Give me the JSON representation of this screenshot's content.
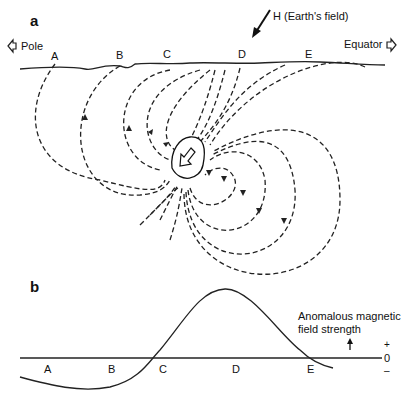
{
  "panel_a": {
    "label": "a",
    "pole": "Pole",
    "equator": "Equator",
    "earth_field": "H (Earth's field)",
    "stations": [
      "A",
      "B",
      "C",
      "D",
      "E"
    ]
  },
  "panel_b": {
    "label": "b",
    "axis_title_line1": "Anomalous magnetic",
    "axis_title_line2": "field strength",
    "plus": "+",
    "zero": "0",
    "minus": "–",
    "stations": [
      "A",
      "B",
      "C",
      "D",
      "E"
    ]
  }
}
